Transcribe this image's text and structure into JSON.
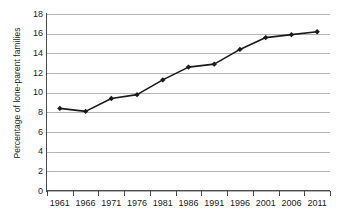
{
  "chart_data": {
    "type": "line",
    "title": "",
    "subtitle": "",
    "xlabel": "",
    "ylabel": "Percentage of lone-parent families",
    "categories": [
      "1961",
      "1966",
      "1971",
      "1976",
      "1981",
      "1986",
      "1991",
      "1996",
      "2001",
      "2006",
      "2011"
    ],
    "x": [
      1961,
      1966,
      1971,
      1976,
      1981,
      1986,
      1991,
      1996,
      2001,
      2006,
      2011
    ],
    "values": [
      8.4,
      8.1,
      9.4,
      9.8,
      11.3,
      12.6,
      12.9,
      14.4,
      15.6,
      15.9,
      16.2
    ],
    "series": [
      {
        "name": "Percentage of lone-parent families",
        "values": [
          8.4,
          8.1,
          9.4,
          9.8,
          11.3,
          12.6,
          12.9,
          14.4,
          15.6,
          15.9,
          16.2
        ]
      }
    ],
    "ylim": [
      0,
      18
    ],
    "ytick_step": 2,
    "yticks": [
      0,
      2,
      4,
      6,
      8,
      10,
      12,
      14,
      16,
      18
    ],
    "ytick_labels": [
      "0",
      "2",
      "4",
      "6",
      "8",
      "10",
      "12",
      "14",
      "16",
      "18"
    ],
    "xtick_labels": [
      "1961",
      "1966",
      "1971",
      "1976",
      "1981",
      "1986",
      "1991",
      "1996",
      "2001",
      "2006",
      "2011"
    ],
    "grid": true,
    "grid_axis": "y",
    "legend": false,
    "legend_position": "none",
    "marker": "diamond",
    "line_color": "#1a1a1a",
    "marker_color": "#1a1a1a",
    "grid_color": "#b4b4b4",
    "axis_color": "#4a4a4a",
    "background_color": "#ffffff",
    "annotations": []
  }
}
